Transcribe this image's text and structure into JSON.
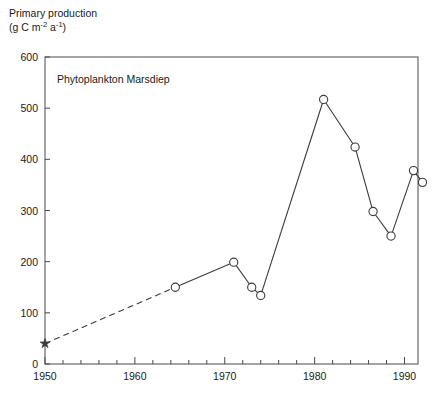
{
  "figure": {
    "axis_title_line1": "Primary production",
    "axis_title_unit_prefix": "(g C m",
    "axis_title_unit_sup1": "-2",
    "axis_title_unit_mid": " a",
    "axis_title_unit_sup2": "-1",
    "axis_title_unit_suffix": ")",
    "annotation": "Phytoplankton Marsdiep",
    "line_color": "#3a3a3a",
    "marker_color": "#ffffff",
    "marker_edge_color": "#3a3a3a",
    "axis_color": "#4a4a4a",
    "background": "#ffffff"
  },
  "chart_data": {
    "type": "line",
    "title": "",
    "annotation": "Phytoplankton Marsdiep",
    "xlabel": "",
    "ylabel": "Primary production (g C m-2 a-1)",
    "xlim": [
      1950,
      1991.5
    ],
    "ylim": [
      0,
      600
    ],
    "ytick_values": [
      0,
      100,
      200,
      300,
      400,
      500,
      600
    ],
    "ytick_labels": [
      "0",
      "100",
      "200",
      "300",
      "400",
      "500",
      "600"
    ],
    "ytick_minor_step": 0,
    "xtick_values": [
      1950,
      1960,
      1970,
      1980,
      1990
    ],
    "xtick_labels": [
      "1950",
      "1960",
      "1970",
      "1980",
      "1990"
    ],
    "xtick_minor_step": 2,
    "grid": false,
    "legend": false,
    "series": [
      {
        "name": "Primary production",
        "marker": "circle-open",
        "linestyle_segments": [
          {
            "from_index": 0,
            "to_index": 1,
            "style": "dashed"
          },
          {
            "from_index": 1,
            "to_index": 9,
            "style": "solid"
          }
        ],
        "x": [
          1950,
          1964.5,
          1971,
          1973,
          1974,
          1981,
          1984.5,
          1986.5,
          1988.5,
          1991,
          1992
        ],
        "y": [
          40,
          150,
          199,
          150,
          134,
          517,
          424,
          298,
          250,
          378,
          355
        ],
        "point_markers": [
          "star",
          "circle-open",
          "circle-open",
          "circle-open",
          "circle-open",
          "circle-open",
          "circle-open",
          "circle-open",
          "circle-open",
          "circle-open",
          "circle-open"
        ]
      }
    ]
  }
}
